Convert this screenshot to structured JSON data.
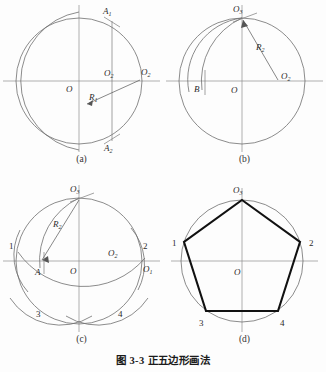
{
  "figure": {
    "caption": "图 3-3  正五边形画法",
    "caption_number": "图 3-3",
    "caption_title": "正五边形画法"
  },
  "panels": [
    {
      "id": "a",
      "sublabel": "(a)",
      "labels": {
        "center": "O",
        "point_right_outer": "O1",
        "point_right_inner": "O2",
        "radius": "R1",
        "top_point": "A1",
        "bottom_point": "A2"
      }
    },
    {
      "id": "b",
      "sublabel": "(b)",
      "labels": {
        "center": "O",
        "top_point": "O3",
        "left_point": "B",
        "right_point": "O2",
        "radius": "R2"
      }
    },
    {
      "id": "c",
      "sublabel": "(c)",
      "labels": {
        "center": "O",
        "top_point": "O3",
        "left_point": "A",
        "right_inner": "O2",
        "right_outer": "O1",
        "radius": "R2",
        "v1": "1",
        "v2": "2",
        "v3": "3",
        "v4": "4"
      }
    },
    {
      "id": "d",
      "sublabel": "(d)",
      "labels": {
        "center": "O",
        "top_vertex": "O3",
        "v1": "1",
        "v2": "2",
        "v3": "3",
        "v4": "4"
      }
    }
  ],
  "colors": {
    "background": "#fdfdfd",
    "construction_line": "#6f6f6f",
    "axis_line": "#8d8d8d",
    "polygon_line": "#111111",
    "text": "#2b2b2b"
  }
}
